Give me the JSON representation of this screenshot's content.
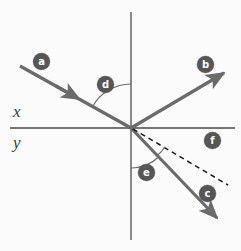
{
  "figure": {
    "background_color": "#fbfbfb",
    "width": 241,
    "height": 251
  },
  "colors": {
    "ray": "#6b6b6b",
    "axis": "#4a4a4a",
    "badge_fill": "#565656",
    "badge_text": "#ffffff",
    "arc": "#6b6b6b",
    "dashed": "#1a1a1a",
    "label_text": "#3a3a3a"
  },
  "axes": {
    "horizontal": {
      "name": "x-axis",
      "label": "x",
      "x1": 10,
      "y1": 128,
      "x2": 235,
      "y2": 128
    },
    "vertical": {
      "name": "y-axis",
      "label": "y",
      "x1": 131,
      "y1": 12,
      "x2": 131,
      "y2": 240
    },
    "labels": {
      "x": "x",
      "y": "y"
    },
    "origin": {
      "x": 131,
      "y": 128
    }
  },
  "rays": [
    {
      "id": "a",
      "label": "a",
      "description": "incident ray travelling down-right toward origin",
      "x1": 20,
      "y1": 66,
      "x2": 131,
      "y2": 128,
      "style": "solid",
      "arrow": "mid",
      "arrow_at": {
        "x": 69,
        "y": 93
      },
      "badge": {
        "x": 41,
        "y": 61
      }
    },
    {
      "id": "b",
      "label": "b",
      "description": "reflected ray travelling up-right from origin",
      "x1": 131,
      "y1": 128,
      "x2": 228,
      "y2": 70,
      "style": "solid",
      "arrow": "end",
      "badge": {
        "x": 205,
        "y": 64
      }
    },
    {
      "id": "c",
      "label": "c",
      "description": "transmitted ray travelling down-right from origin",
      "x1": 131,
      "y1": 128,
      "x2": 222,
      "y2": 223,
      "style": "solid",
      "arrow": "end",
      "badge": {
        "x": 207,
        "y": 193
      }
    },
    {
      "id": "f",
      "label": "f",
      "description": "dashed reference line down-right from origin",
      "x1": 131,
      "y1": 128,
      "x2": 228,
      "y2": 185,
      "style": "dashed",
      "arrow": "none",
      "badge": {
        "x": 212,
        "y": 140
      }
    }
  ],
  "angles": [
    {
      "id": "d",
      "label": "d",
      "description": "angle between incident ray a and the upper y-axis",
      "radius": 44,
      "start_deg": 209,
      "end_deg": 270,
      "badge": {
        "x": 105,
        "y": 84
      }
    },
    {
      "id": "e",
      "label": "e",
      "description": "angle between lower y-axis and transmitted ray c",
      "radius": 40,
      "start_deg": 46,
      "end_deg": 90,
      "badge": {
        "x": 146,
        "y": 172
      }
    },
    {
      "id": "f-arc",
      "label": "",
      "description": "small arc between dashed line f and transmitted ray c",
      "radius": 38,
      "start_deg": 30,
      "end_deg": 46,
      "badge": null
    }
  ],
  "badges": [
    {
      "id": "a",
      "label": "a",
      "x": 41,
      "y": 61
    },
    {
      "id": "b",
      "label": "b",
      "x": 205,
      "y": 64
    },
    {
      "id": "c",
      "label": "c",
      "x": 207,
      "y": 193
    },
    {
      "id": "d",
      "label": "d",
      "x": 105,
      "y": 84
    },
    {
      "id": "e",
      "label": "e",
      "x": 146,
      "y": 172
    },
    {
      "id": "f",
      "label": "f",
      "x": 212,
      "y": 140
    }
  ]
}
